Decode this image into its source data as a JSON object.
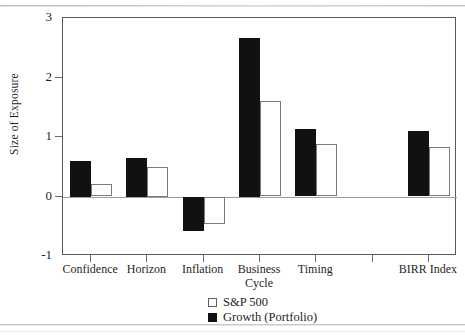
{
  "chart_data": {
    "type": "bar",
    "title": "",
    "xlabel": "",
    "ylabel": "Size of Exposure",
    "ylim": [
      -1,
      3
    ],
    "yticks": [
      3,
      2,
      1,
      0,
      -1
    ],
    "ytick_labels": [
      "3",
      "2",
      "1",
      "0",
      "-1"
    ],
    "grid": false,
    "legend_position": "below-plot-center",
    "categories": [
      "Confidence",
      "Horizon",
      "Inflation",
      "Business\nCycle",
      "Timing",
      "BIRR Index"
    ],
    "series": [
      {
        "name": "Growth (Portfolio)",
        "color": "#111111",
        "values": [
          0.6,
          0.65,
          -0.57,
          2.67,
          1.13,
          1.1
        ]
      },
      {
        "name": "S&P 500",
        "color": "#ffffff",
        "values": [
          0.21,
          0.5,
          -0.45,
          1.6,
          0.88,
          0.83
        ]
      }
    ],
    "legend": [
      {
        "label": "S&P 500",
        "swatch": "white"
      },
      {
        "label": "Growth (Portfolio)",
        "swatch": "black"
      }
    ]
  },
  "colors": {
    "portfolio": "#111111",
    "benchmark": "#ffffff",
    "axis": "#5a5a5a",
    "zero_line": "#9d9d9d",
    "background": "#ffffff"
  }
}
